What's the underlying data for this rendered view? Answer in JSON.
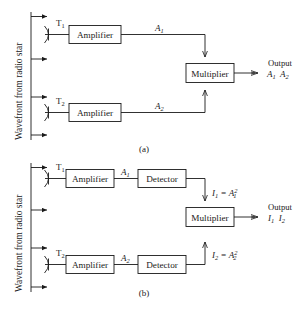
{
  "figure": {
    "background_color": "#ffffff",
    "line_color": "#1a1a1a",
    "wavefront_label": "Wavefront from radio star"
  },
  "panel_a": {
    "caption": "(a)",
    "antenna_top_label": "T",
    "antenna_top_sub": "1",
    "antenna_bottom_label": "T",
    "antenna_bottom_sub": "2",
    "amplifier_top_label": "Amplifier",
    "amplifier_bottom_label": "Amplifier",
    "signal_top_label": "A",
    "signal_top_sub": "1",
    "signal_bottom_label": "A",
    "signal_bottom_sub": "2",
    "multiplier_label": "Multiplier",
    "output_title": "Output",
    "output_term_1": "A",
    "output_term_1_sub": "1",
    "output_term_2": "A",
    "output_term_2_sub": "2"
  },
  "panel_b": {
    "caption": "(b)",
    "antenna_top_label": "T",
    "antenna_top_sub": "1",
    "antenna_bottom_label": "T",
    "antenna_bottom_sub": "2",
    "amplifier_top_label": "Amplifier",
    "amplifier_bottom_label": "Amplifier",
    "detector_top_label": "Detector",
    "detector_bottom_label": "Detector",
    "signal_top_label": "A",
    "signal_top_sub": "1",
    "signal_bottom_label": "A",
    "signal_bottom_sub": "2",
    "intensity_top_lhs": "I",
    "intensity_top_lhs_sub": "1",
    "intensity_top_eq": "=",
    "intensity_top_rhs": "A",
    "intensity_top_rhs_sub": "1",
    "intensity_top_rhs_sup": "2",
    "intensity_bottom_lhs": "I",
    "intensity_bottom_lhs_sub": "2",
    "intensity_bottom_eq": "=",
    "intensity_bottom_rhs": "A",
    "intensity_bottom_rhs_sub": "2",
    "intensity_bottom_rhs_sup": "2",
    "multiplier_label": "Multiplier",
    "output_title": "Output",
    "output_term_1": "I",
    "output_term_1_sub": "1",
    "output_term_2": "I",
    "output_term_2_sub": "2"
  }
}
